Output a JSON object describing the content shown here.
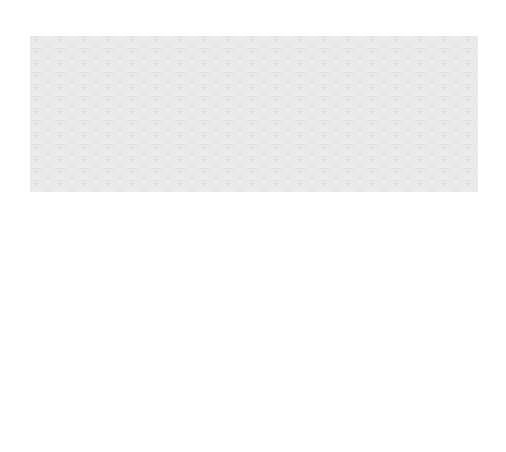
{
  "map": {
    "title": "",
    "countries": {
      "usa": {
        "line1": "UNITED STATES",
        "line2": "OF AMERICA"
      },
      "mexico": "MEXICO",
      "cuba": "CUBA"
    },
    "cities": {
      "san_francisco": {
        "line1": "San",
        "line2": "Francisco"
      },
      "los_angeles": "Los Angeles",
      "milwaukee": "Milwaukee",
      "chicago": "Chicago",
      "st_louis": "St. Louis",
      "cleveland": "Cleveland",
      "new_york": "New York",
      "washington": "Washington D.C.",
      "new_orleans": "New Orleans",
      "laredo": "Laredo",
      "monterrey": "Monterrey",
      "mexico_city": "Mexico City",
      "vera_cruz": "Vera Cruz",
      "havana": "Havana",
      "santiago": {
        "line1": "Santiago",
        "line2": "de Cuba"
      },
      "panama": "Panama"
    },
    "annotations": {
      "boat_from_japan": {
        "line1": "Boat",
        "line2": "from",
        "line3": "Japan"
      },
      "boat_to_ecuador": "Boat to Ecuador"
    },
    "colors": {
      "route": "#3a3a3a",
      "water": "#e6e6e6",
      "land": "#ffffff",
      "border": "#222222"
    }
  }
}
